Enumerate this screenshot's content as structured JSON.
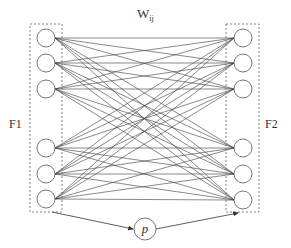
{
  "diagram": {
    "title_label": "W",
    "title_subscript": "ij",
    "layer_left_label": "F1",
    "layer_right_label": "F2",
    "param_node_label": "p",
    "colors": {
      "line": "#3a3a3a",
      "node_stroke": "#555555",
      "box_stroke": "#666666",
      "background": "#ffffff"
    },
    "left_layer": {
      "box": {
        "x": 30,
        "y": 24,
        "w": 32,
        "h": 188
      },
      "node_cx": 46,
      "node_r": 9,
      "node_cy": [
        38,
        63,
        89,
        148,
        174,
        199
      ]
    },
    "right_layer": {
      "box": {
        "x": 226,
        "y": 24,
        "w": 33,
        "h": 188
      },
      "node_cx": 243,
      "node_r": 9,
      "node_cy": [
        38,
        63,
        89,
        148,
        174,
        200
      ]
    },
    "param_node": {
      "cx": 145,
      "cy": 229,
      "r": 11
    },
    "connections": "fully connected: every F1 node to every F2 node"
  }
}
